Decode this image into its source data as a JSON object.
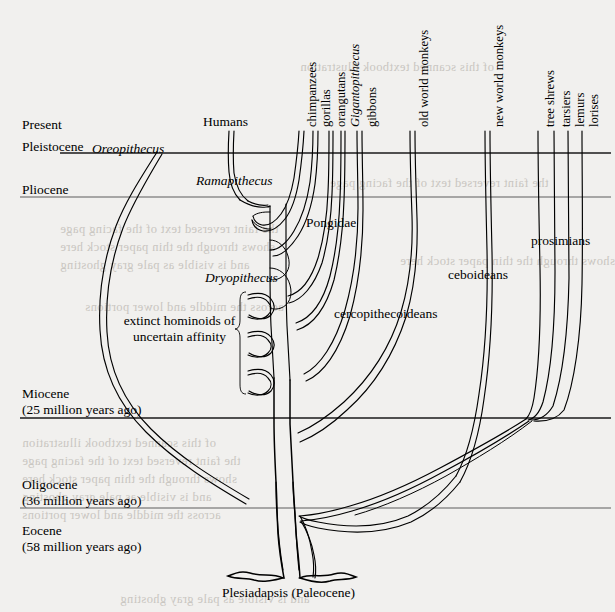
{
  "figure": {
    "root_label_italic": "Plesiadapsis",
    "root_label_plain": " (Paleocene)"
  },
  "epochs": [
    {
      "name": "Present",
      "sub": ""
    },
    {
      "name": "Pleistocene",
      "sub": ""
    },
    {
      "name": "Pliocene",
      "sub": ""
    },
    {
      "name": "Miocene",
      "sub": "(25 million years ago)"
    },
    {
      "name": "Oligocene",
      "sub": "(36 million years ago)"
    },
    {
      "name": "Eocene",
      "sub": "(58 million years ago)"
    }
  ],
  "tip_labels": [
    {
      "text": "chimpanzees",
      "italic": false
    },
    {
      "text": "gorillas",
      "italic": false
    },
    {
      "text": "orangutans",
      "italic": false
    },
    {
      "text": "Gigantopithecus",
      "italic": true
    },
    {
      "text": "gibbons",
      "italic": false
    },
    {
      "text": "old world monkeys",
      "italic": false
    },
    {
      "text": "new world monkeys",
      "italic": false
    },
    {
      "text": "tree shrews",
      "italic": false
    },
    {
      "text": "tarsiers",
      "italic": false
    },
    {
      "text": "lemurs",
      "italic": false
    },
    {
      "text": "lorises",
      "italic": false
    }
  ],
  "inline_labels": {
    "humans": "Humans",
    "oreopithecus": "Oreopithecus",
    "ramapithecus": "Ramapithecus",
    "dryopithecus": "Dryopithecus",
    "pongidae": "Pongidae",
    "cercopithecoideans": "cercopithecoideans",
    "ceboideans": "ceboideans",
    "prosimians": "prosimians",
    "extinct_line1": "extinct hominoids of",
    "extinct_line2": "uncertain affinity"
  },
  "bleed_through_lines": [
    "the faint reversed text of the facing page",
    "shows through the thin paper stock here",
    "and is visible as pale gray ghosting",
    "across the middle and lower portions",
    "of this scanned textbook illustration"
  ],
  "colors": {
    "paper": "#f1f0ee",
    "ink": "#000000",
    "rule": "#5c5c5c",
    "bleed": "#c9c6c1"
  }
}
